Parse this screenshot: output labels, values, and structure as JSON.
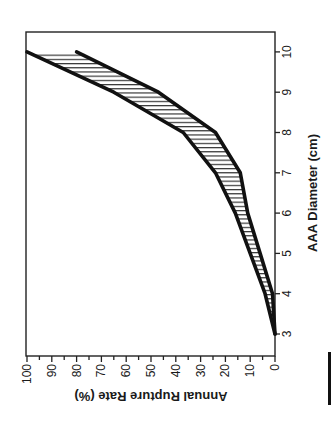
{
  "chart_data": {
    "type": "area",
    "orientation": "rotated-90-clockwise",
    "title": "",
    "xlabel": "AAA Diameter (cm)",
    "ylabel": "Annual Rupture Rate (%)",
    "x": [
      3,
      4,
      5,
      6,
      7,
      8,
      9,
      10
    ],
    "xticks": [
      "3",
      "4",
      "5",
      "6",
      "7",
      "8",
      "9",
      "10"
    ],
    "yticks": [
      "0",
      "10",
      "20",
      "30",
      "40",
      "50",
      "60",
      "70",
      "80",
      "90",
      "100"
    ],
    "xlim": [
      2.6,
      10.5
    ],
    "ylim": [
      0,
      100
    ],
    "grid": false,
    "legend": null,
    "series": [
      {
        "name": "Upper bound",
        "values": [
          0,
          4,
          10,
          16,
          24,
          37,
          65,
          100
        ]
      },
      {
        "name": "Lower bound",
        "values": [
          0,
          1,
          6,
          11,
          14,
          24,
          47,
          80
        ]
      }
    ],
    "fill_between": {
      "pattern": "horizontal-hatch",
      "between": [
        "Upper bound",
        "Lower bound"
      ]
    }
  },
  "labels": {
    "x_axis_title": "AAA Diameter (cm)",
    "y_axis_title": "Annual Rupture Rate (%)"
  }
}
